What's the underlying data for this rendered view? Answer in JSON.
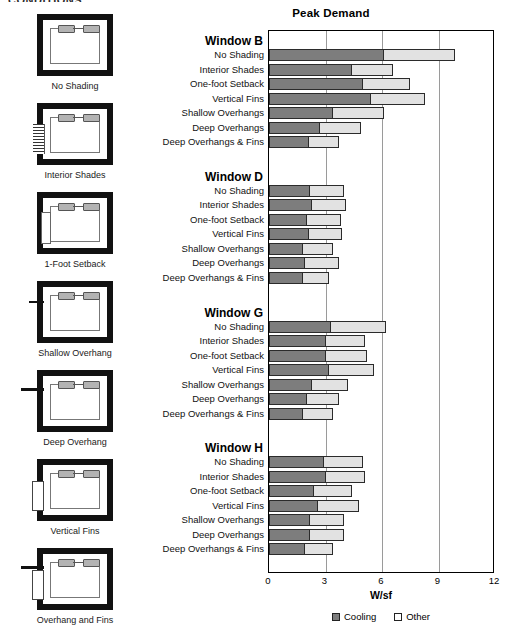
{
  "top_heading": "CONDITIONS",
  "thumbnails": {
    "items": [
      {
        "label": "No Shading",
        "feature": "none"
      },
      {
        "label": "Interior Shades",
        "feature": "shade-hatch"
      },
      {
        "label": "1-Foot Setback",
        "feature": "setback"
      },
      {
        "label": "Shallow Overhang",
        "feature": "overhang-s"
      },
      {
        "label": "Deep Overhang",
        "feature": "overhang-d"
      },
      {
        "label": "Vertical Fins",
        "feature": "fins"
      },
      {
        "label": "Overhang and Fins",
        "feature": "fins-overhang"
      }
    ]
  },
  "colors": {
    "cooling": "#7d7d7d",
    "other": "#e2e2e2",
    "axis": "#000000",
    "grid": "#9a9a9a"
  },
  "chart_data": {
    "type": "bar",
    "orientation": "horizontal",
    "stacked": true,
    "title": "Peak Demand",
    "xlabel": "W/sf",
    "ylabel": "",
    "xlim": [
      0,
      12
    ],
    "xticks": [
      0,
      3,
      6,
      9,
      12
    ],
    "xticklabels": [
      "0",
      "3",
      "6",
      "9",
      "12"
    ],
    "grid": true,
    "legend_position": "bottom",
    "series": [
      {
        "name": "Cooling",
        "color": "#7d7d7d"
      },
      {
        "name": "Other",
        "color": "#e2e2e2"
      }
    ],
    "categories": [
      "No Shading",
      "Interior Shades",
      "One-foot Setback",
      "Vertical Fins",
      "Shallow Overhangs",
      "Deep Overhangs",
      "Deep Overhangs & Fins"
    ],
    "groups": [
      {
        "name": "Window B",
        "cooling": [
          6.1,
          4.4,
          5.0,
          5.4,
          3.4,
          2.7,
          2.1
        ],
        "other": [
          3.8,
          2.2,
          2.5,
          2.9,
          2.7,
          2.2,
          1.6
        ],
        "totals": [
          9.9,
          6.6,
          7.5,
          8.3,
          6.1,
          4.9,
          3.7
        ]
      },
      {
        "name": "Window D",
        "cooling": [
          2.2,
          2.3,
          2.0,
          2.1,
          1.8,
          1.9,
          1.8
        ],
        "other": [
          1.8,
          1.8,
          1.8,
          1.8,
          1.6,
          1.8,
          1.4
        ],
        "totals": [
          4.0,
          4.1,
          3.8,
          3.9,
          3.4,
          3.7,
          3.2
        ]
      },
      {
        "name": "Window G",
        "cooling": [
          3.3,
          3.0,
          3.0,
          3.2,
          2.3,
          2.0,
          1.8
        ],
        "other": [
          2.9,
          2.1,
          2.2,
          2.4,
          1.9,
          1.7,
          1.6
        ],
        "totals": [
          6.2,
          5.1,
          5.2,
          5.6,
          4.2,
          3.7,
          3.4
        ]
      },
      {
        "name": "Window H",
        "cooling": [
          2.9,
          3.0,
          2.4,
          2.6,
          2.2,
          2.2,
          1.9
        ],
        "other": [
          2.1,
          2.1,
          2.0,
          2.2,
          1.8,
          1.8,
          1.5
        ],
        "totals": [
          5.0,
          5.1,
          4.4,
          4.8,
          4.0,
          4.0,
          3.4
        ]
      }
    ]
  }
}
